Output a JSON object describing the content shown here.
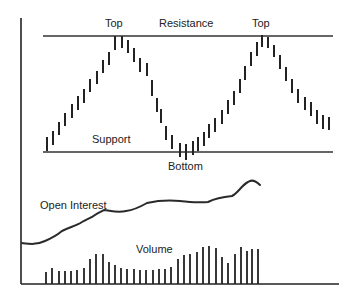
{
  "labels": {
    "top_left": "Top",
    "resistance": "Resistance",
    "top_right": "Top",
    "support": "Support",
    "bottom": "Bottom",
    "open_interest": "Open Interest",
    "volume": "Volume"
  },
  "colors": {
    "ink": "#222222",
    "background": "#ffffff"
  },
  "chart_data": {
    "type": "diagram",
    "title": "",
    "levels": [
      {
        "name": "Resistance",
        "y": 36,
        "x1": 43,
        "x2": 333
      },
      {
        "name": "Support",
        "y": 152,
        "x1": 43,
        "x2": 333
      }
    ],
    "annotations": [
      {
        "text": "Top",
        "x": 115,
        "y": 27
      },
      {
        "text": "Resistance",
        "x": 189,
        "y": 27
      },
      {
        "text": "Top",
        "x": 262,
        "y": 27
      },
      {
        "text": "Support",
        "x": 112,
        "y": 141
      },
      {
        "text": "Bottom",
        "x": 185,
        "y": 168
      },
      {
        "text": "Open Interest",
        "x": 78,
        "y": 208
      },
      {
        "text": "Volume",
        "x": 151,
        "y": 252
      }
    ],
    "axes": {
      "y_axis": {
        "x": 21,
        "y1": 18,
        "y2": 284
      },
      "x_axis": {
        "y": 284,
        "x1": 21,
        "x2": 339
      }
    },
    "price_bars": [
      {
        "x": 47,
        "top": 137,
        "bottom": 151
      },
      {
        "x": 53,
        "top": 131,
        "bottom": 145
      },
      {
        "x": 59,
        "top": 122,
        "bottom": 135
      },
      {
        "x": 65,
        "top": 113,
        "bottom": 126
      },
      {
        "x": 72,
        "top": 104,
        "bottom": 118
      },
      {
        "x": 78,
        "top": 96,
        "bottom": 110
      },
      {
        "x": 84,
        "top": 89,
        "bottom": 103
      },
      {
        "x": 90,
        "top": 79,
        "bottom": 92
      },
      {
        "x": 97,
        "top": 71,
        "bottom": 84
      },
      {
        "x": 103,
        "top": 60,
        "bottom": 73
      },
      {
        "x": 109,
        "top": 52,
        "bottom": 65
      },
      {
        "x": 115,
        "top": 36,
        "bottom": 50
      },
      {
        "x": 122,
        "top": 36,
        "bottom": 48
      },
      {
        "x": 128,
        "top": 40,
        "bottom": 53
      },
      {
        "x": 134,
        "top": 48,
        "bottom": 62
      },
      {
        "x": 140,
        "top": 58,
        "bottom": 72
      },
      {
        "x": 147,
        "top": 63,
        "bottom": 76
      },
      {
        "x": 152,
        "top": 80,
        "bottom": 96
      },
      {
        "x": 157,
        "top": 98,
        "bottom": 112
      },
      {
        "x": 161,
        "top": 109,
        "bottom": 123
      },
      {
        "x": 166,
        "top": 126,
        "bottom": 140
      },
      {
        "x": 172,
        "top": 135,
        "bottom": 149
      },
      {
        "x": 180,
        "top": 143,
        "bottom": 157
      },
      {
        "x": 186,
        "top": 144,
        "bottom": 160
      },
      {
        "x": 193,
        "top": 141,
        "bottom": 155
      },
      {
        "x": 198,
        "top": 137,
        "bottom": 151
      },
      {
        "x": 204,
        "top": 132,
        "bottom": 146
      },
      {
        "x": 209,
        "top": 124,
        "bottom": 138
      },
      {
        "x": 215,
        "top": 118,
        "bottom": 132
      },
      {
        "x": 222,
        "top": 110,
        "bottom": 124
      },
      {
        "x": 228,
        "top": 100,
        "bottom": 114
      },
      {
        "x": 234,
        "top": 91,
        "bottom": 105
      },
      {
        "x": 240,
        "top": 79,
        "bottom": 93
      },
      {
        "x": 245,
        "top": 66,
        "bottom": 80
      },
      {
        "x": 251,
        "top": 52,
        "bottom": 66
      },
      {
        "x": 257,
        "top": 42,
        "bottom": 56
      },
      {
        "x": 262,
        "top": 35,
        "bottom": 47
      },
      {
        "x": 268,
        "top": 37,
        "bottom": 48
      },
      {
        "x": 274,
        "top": 45,
        "bottom": 57
      },
      {
        "x": 280,
        "top": 55,
        "bottom": 69
      },
      {
        "x": 286,
        "top": 67,
        "bottom": 81
      },
      {
        "x": 292,
        "top": 79,
        "bottom": 93
      },
      {
        "x": 298,
        "top": 89,
        "bottom": 103
      },
      {
        "x": 305,
        "top": 97,
        "bottom": 110
      },
      {
        "x": 311,
        "top": 102,
        "bottom": 116
      },
      {
        "x": 317,
        "top": 110,
        "bottom": 124
      },
      {
        "x": 323,
        "top": 115,
        "bottom": 129
      },
      {
        "x": 329,
        "top": 117,
        "bottom": 130
      }
    ],
    "open_interest_path": "M22 243 C30 244, 36 245, 45 241 C52 238, 56 236, 62 231 C70 227, 76 226, 82 222 C87 219, 91 218, 95 215 C99 212, 101 212, 104 210 C112 211, 118 213, 126 211 C134 210, 140 207, 147 203 C156 201, 168 200, 180 201 C192 202, 200 203, 208 202 C216 198, 222 197, 232 196 C238 193, 242 185, 248 182 C252 179, 256 181, 260 185",
    "volume_bars": [
      {
        "x": 46,
        "h": 12
      },
      {
        "x": 52,
        "h": 16
      },
      {
        "x": 59,
        "h": 13
      },
      {
        "x": 65,
        "h": 13
      },
      {
        "x": 71,
        "h": 13
      },
      {
        "x": 77,
        "h": 14
      },
      {
        "x": 84,
        "h": 16
      },
      {
        "x": 90,
        "h": 25
      },
      {
        "x": 96,
        "h": 30
      },
      {
        "x": 103,
        "h": 30
      },
      {
        "x": 109,
        "h": 22
      },
      {
        "x": 115,
        "h": 19
      },
      {
        "x": 121,
        "h": 16
      },
      {
        "x": 127,
        "h": 15
      },
      {
        "x": 134,
        "h": 15
      },
      {
        "x": 140,
        "h": 14
      },
      {
        "x": 146,
        "h": 14
      },
      {
        "x": 153,
        "h": 14
      },
      {
        "x": 159,
        "h": 15
      },
      {
        "x": 165,
        "h": 15
      },
      {
        "x": 171,
        "h": 17
      },
      {
        "x": 178,
        "h": 25
      },
      {
        "x": 184,
        "h": 29
      },
      {
        "x": 190,
        "h": 30
      },
      {
        "x": 197,
        "h": 32
      },
      {
        "x": 203,
        "h": 37
      },
      {
        "x": 209,
        "h": 38
      },
      {
        "x": 216,
        "h": 36
      },
      {
        "x": 222,
        "h": 27
      },
      {
        "x": 228,
        "h": 21
      },
      {
        "x": 235,
        "h": 30
      },
      {
        "x": 241,
        "h": 37
      },
      {
        "x": 247,
        "h": 33
      },
      {
        "x": 252,
        "h": 35
      },
      {
        "x": 258,
        "h": 35
      }
    ]
  }
}
